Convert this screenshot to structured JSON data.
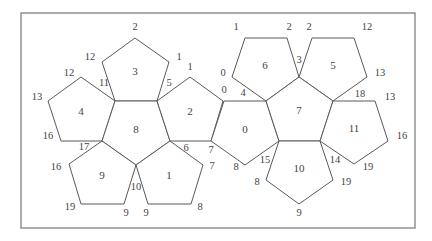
{
  "diagram": {
    "colors": {
      "line": "#5a5a5a",
      "frame": "#8a8a8a",
      "text": "#444444",
      "background": "#ffffff"
    },
    "frame": {
      "x": 21,
      "y": 13,
      "width": 394,
      "height": 215
    },
    "faces": [
      {
        "id": "3",
        "label": "3",
        "points": [
          [
            135,
            38
          ],
          [
            169,
            62
          ],
          [
            157,
            101
          ],
          [
            115,
            101
          ],
          [
            102,
            62
          ]
        ],
        "label_pos": [
          135,
          72
        ]
      },
      {
        "id": "4",
        "label": "4",
        "points": [
          [
            81,
            77
          ],
          [
            115,
            101
          ],
          [
            102,
            141
          ],
          [
            61,
            141
          ],
          [
            48,
            101
          ]
        ],
        "label_pos": [
          81,
          112
        ]
      },
      {
        "id": "8",
        "label": "8",
        "points": [
          [
            115,
            101
          ],
          [
            157,
            101
          ],
          [
            170,
            141
          ],
          [
            136,
            165
          ],
          [
            102,
            141
          ]
        ],
        "label_pos": [
          136,
          130
        ]
      },
      {
        "id": "2",
        "label": "2",
        "points": [
          [
            190,
            77
          ],
          [
            223,
            101
          ],
          [
            211,
            141
          ],
          [
            170,
            141
          ],
          [
            157,
            101
          ]
        ],
        "label_pos": [
          190,
          112
        ]
      },
      {
        "id": "9",
        "label": "9",
        "points": [
          [
            102,
            141
          ],
          [
            136,
            165
          ],
          [
            124,
            204
          ],
          [
            81,
            204
          ],
          [
            69,
            164
          ]
        ],
        "label_pos": [
          102,
          176
        ]
      },
      {
        "id": "1",
        "label": "1",
        "points": [
          [
            170,
            141
          ],
          [
            203,
            165
          ],
          [
            191,
            204
          ],
          [
            148,
            204
          ],
          [
            136,
            165
          ]
        ],
        "label_pos": [
          169,
          176
        ]
      },
      {
        "id": "0",
        "label": "0",
        "points": [
          [
            224,
            101
          ],
          [
            266,
            101
          ],
          [
            279,
            141
          ],
          [
            245,
            165
          ],
          [
            211,
            141
          ]
        ],
        "label_pos": [
          245,
          130
        ]
      },
      {
        "id": "6",
        "label": "6",
        "points": [
          [
            245,
            38
          ],
          [
            287,
            38
          ],
          [
            299,
            77
          ],
          [
            266,
            101
          ],
          [
            232,
            77
          ]
        ],
        "label_pos": [
          265,
          66
        ]
      },
      {
        "id": "5",
        "label": "5",
        "points": [
          [
            312,
            38
          ],
          [
            354,
            38
          ],
          [
            367,
            77
          ],
          [
            333,
            101
          ],
          [
            299,
            77
          ]
        ],
        "label_pos": [
          333,
          66
        ]
      },
      {
        "id": "7",
        "label": "7",
        "points": [
          [
            266,
            101
          ],
          [
            299,
            77
          ],
          [
            333,
            101
          ],
          [
            320,
            141
          ],
          [
            279,
            141
          ]
        ],
        "label_pos": [
          299,
          111
        ]
      },
      {
        "id": "11",
        "label": "11",
        "points": [
          [
            333,
            101
          ],
          [
            375,
            101
          ],
          [
            388,
            141
          ],
          [
            354,
            164
          ],
          [
            320,
            141
          ]
        ],
        "label_pos": [
          354,
          129
        ]
      },
      {
        "id": "10",
        "label": "10",
        "points": [
          [
            279,
            141
          ],
          [
            320,
            141
          ],
          [
            333,
            180
          ],
          [
            299,
            204
          ],
          [
            266,
            180
          ]
        ],
        "label_pos": [
          299,
          169
        ]
      }
    ],
    "vertex_labels": [
      {
        "text": "2",
        "x": 135,
        "y": 28
      },
      {
        "text": "12",
        "x": 90,
        "y": 58
      },
      {
        "text": "1",
        "x": 179,
        "y": 58
      },
      {
        "text": "12",
        "x": 69,
        "y": 74
      },
      {
        "text": "11",
        "x": 104,
        "y": 84
      },
      {
        "text": "5",
        "x": 169,
        "y": 84
      },
      {
        "text": "1",
        "x": 190,
        "y": 68
      },
      {
        "text": "13",
        "x": 37,
        "y": 98
      },
      {
        "text": "16",
        "x": 48,
        "y": 137
      },
      {
        "text": "17",
        "x": 84,
        "y": 148
      },
      {
        "text": "6",
        "x": 186,
        "y": 149
      },
      {
        "text": "7",
        "x": 211,
        "y": 151
      },
      {
        "text": "16",
        "x": 56,
        "y": 168
      },
      {
        "text": "7",
        "x": 212,
        "y": 167
      },
      {
        "text": "10",
        "x": 136,
        "y": 188
      },
      {
        "text": "19",
        "x": 70,
        "y": 208
      },
      {
        "text": "9",
        "x": 126,
        "y": 214
      },
      {
        "text": "9",
        "x": 146,
        "y": 214
      },
      {
        "text": "8",
        "x": 200,
        "y": 208
      },
      {
        "text": "0",
        "x": 223,
        "y": 74
      },
      {
        "text": "0",
        "x": 224,
        "y": 91
      },
      {
        "text": "4",
        "x": 243,
        "y": 94
      },
      {
        "text": "8",
        "x": 236,
        "y": 168
      },
      {
        "text": "15",
        "x": 265,
        "y": 161
      },
      {
        "text": "1",
        "x": 236,
        "y": 28
      },
      {
        "text": "2",
        "x": 289,
        "y": 28
      },
      {
        "text": "2",
        "x": 309,
        "y": 28
      },
      {
        "text": "12",
        "x": 367,
        "y": 28
      },
      {
        "text": "3",
        "x": 299,
        "y": 61
      },
      {
        "text": "13",
        "x": 380,
        "y": 74
      },
      {
        "text": "18",
        "x": 360,
        "y": 95
      },
      {
        "text": "13",
        "x": 390,
        "y": 98
      },
      {
        "text": "16",
        "x": 402,
        "y": 137
      },
      {
        "text": "14",
        "x": 335,
        "y": 161
      },
      {
        "text": "19",
        "x": 368,
        "y": 168
      },
      {
        "text": "8",
        "x": 257,
        "y": 183
      },
      {
        "text": "19",
        "x": 346,
        "y": 183
      },
      {
        "text": "9",
        "x": 299,
        "y": 214
      }
    ]
  }
}
